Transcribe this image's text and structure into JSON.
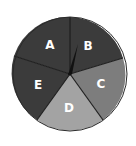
{
  "diagram": {
    "type": "spinner",
    "center": [
      70,
      74
    ],
    "radius": 57,
    "sections": [
      {
        "label": "A",
        "color": "#3b3b3b"
      },
      {
        "label": "B",
        "color": "#3b3b3b"
      },
      {
        "label": "C",
        "color": "#7d7d7d"
      },
      {
        "label": "D",
        "color": "#a3a3a3"
      },
      {
        "label": "E",
        "color": "#3b3b3b"
      }
    ],
    "pointer": {
      "color": "#111111",
      "points_to": "B"
    },
    "border_color": "#222222"
  }
}
